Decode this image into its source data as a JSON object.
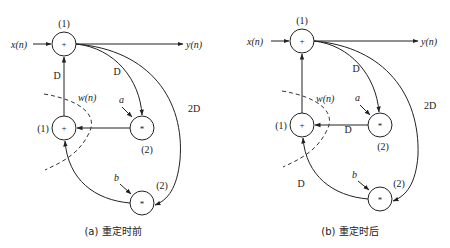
{
  "diagrams": [
    {
      "id": "a",
      "caption": "(a) 重定时前",
      "input_label": "x(n)",
      "output_label": "y(n)",
      "cut_label": "w(n)",
      "nodes": {
        "top_adder": {
          "symbol": "+",
          "time": "(1)"
        },
        "mid_adder": {
          "symbol": "+",
          "time": "(1)"
        },
        "mult_a": {
          "symbol": "*",
          "time": "(2)",
          "coef": "a"
        },
        "mult_b": {
          "symbol": "*",
          "time": "(2)",
          "coef": "b"
        }
      },
      "delays": {
        "mid_to_top": "D",
        "top_to_a": "D",
        "top_to_b": "2D",
        "a_to_mid": "",
        "b_to_mid": ""
      }
    },
    {
      "id": "b",
      "caption": "(b) 重定时后",
      "input_label": "x(n)",
      "output_label": "y(n)",
      "cut_label": "w(n)",
      "nodes": {
        "top_adder": {
          "symbol": "+",
          "time": "(1)"
        },
        "mid_adder": {
          "symbol": "+",
          "time": "(1)"
        },
        "mult_a": {
          "symbol": "*",
          "time": "(2)",
          "coef": "a"
        },
        "mult_b": {
          "symbol": "*",
          "time": "(2)",
          "coef": "b"
        }
      },
      "delays": {
        "mid_to_top": "",
        "top_to_a": "D",
        "top_to_b": "2D",
        "a_to_mid": "D",
        "b_to_mid": "D"
      }
    }
  ]
}
